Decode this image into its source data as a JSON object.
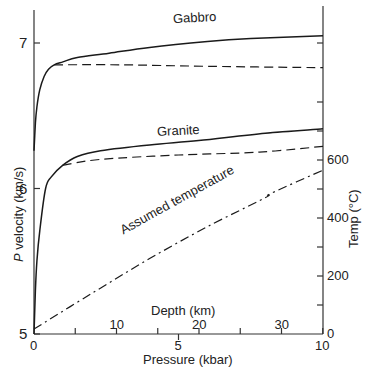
{
  "chart_data": {
    "type": "line",
    "title": "",
    "xlabel": "Pressure (kbar)",
    "xlabel_secondary": "Depth (km)",
    "ylabel": "P velocity (km/s)",
    "ylabel_right": "Temp (°C)",
    "xlim": [
      0,
      10
    ],
    "ylim": [
      5,
      7.25
    ],
    "ylim_right": [
      0,
      800
    ],
    "x_ticks": [
      0,
      5,
      10
    ],
    "x_ticks_labels": [
      "0",
      "5",
      "10"
    ],
    "x_minor_ticks": [
      5
    ],
    "depth_ticks": [
      5,
      10,
      15,
      20,
      25,
      30,
      35
    ],
    "depth_tick_labels": [
      "10",
      "20",
      "30"
    ],
    "depth_tick_label_values": [
      10,
      20,
      30
    ],
    "y_ticks": [
      5,
      6,
      7
    ],
    "y_ticks_labels": [
      "5",
      "6",
      "7"
    ],
    "y_right_ticks": [
      0,
      100,
      200,
      300,
      400,
      500,
      600,
      700,
      800
    ],
    "y_right_tick_labels": [
      "0",
      "200",
      "400",
      "600"
    ],
    "y_right_tick_label_values": [
      0,
      200,
      400,
      600
    ],
    "grid": false,
    "legend": "inline labels",
    "series": [
      {
        "name": "Gabbro",
        "style": "solid",
        "axis": "left",
        "x": [
          0,
          0.05,
          0.1,
          0.2,
          0.35,
          0.5,
          0.7,
          1.0,
          1.5,
          2.6,
          4.0,
          6.0,
          7.5,
          10
        ],
        "y": [
          6.26,
          6.45,
          6.56,
          6.68,
          6.77,
          6.82,
          6.85,
          6.87,
          6.9,
          6.93,
          6.97,
          7.01,
          7.03,
          7.05
        ]
      },
      {
        "name": "Gabbro (dashed)",
        "style": "dashed",
        "axis": "left",
        "x": [
          0.7,
          3,
          6,
          10
        ],
        "y": [
          6.85,
          6.85,
          6.84,
          6.83
        ]
      },
      {
        "name": "Granite",
        "style": "solid",
        "axis": "left",
        "x": [
          0,
          0.05,
          0.1,
          0.2,
          0.4,
          0.6,
          1.0,
          1.5,
          2.3,
          4.0,
          5.7,
          8.0,
          10
        ],
        "y": [
          5.0,
          5.3,
          5.5,
          5.71,
          6.0,
          6.08,
          6.16,
          6.22,
          6.26,
          6.3,
          6.33,
          6.38,
          6.41
        ]
      },
      {
        "name": "Granite (dashed)",
        "style": "dashed",
        "axis": "left",
        "x": [
          1.0,
          2.3,
          5,
          7.8,
          10
        ],
        "y": [
          6.16,
          6.2,
          6.23,
          6.25,
          6.29
        ]
      },
      {
        "name": "Assumed temperature",
        "style": "dash-dot",
        "axis": "right",
        "x": [
          0,
          2,
          4,
          6,
          8,
          8.2,
          10
        ],
        "y": [
          17,
          140,
          260,
          370,
          470,
          485,
          565
        ]
      }
    ],
    "annotations": [
      "Gabbro",
      "Granite",
      "Assumed temperature"
    ]
  },
  "labels": {
    "gabbro": "Gabbro",
    "granite": "Granite",
    "assumed_temperature": "Assumed temperature",
    "depth_title": "Depth (km)",
    "pressure_title": "Pressure (kbar)",
    "velocity_title_italic": "P",
    "velocity_title_rest": " velocity (km/s)",
    "temp_title": "Temp (°C)"
  }
}
